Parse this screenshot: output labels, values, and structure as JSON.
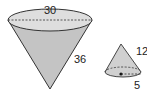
{
  "large_cone": {
    "diameter_label": "30",
    "slant_label": "36"
  },
  "small_cone": {
    "slant_label": "12",
    "radius_label": "5"
  },
  "colors": {
    "cone_fill": "#c8c8c8",
    "top_fill": "#dcdcdc",
    "stroke": "#333333"
  }
}
